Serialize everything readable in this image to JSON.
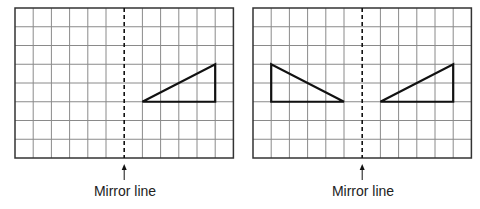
{
  "colors": {
    "grid_line": "#8a8a8a",
    "border": "#333333",
    "shape": "#111111",
    "mirror": "#111111",
    "background": "#ffffff"
  },
  "grid": {
    "columns": 12,
    "rows": 8,
    "mirror_column": 6
  },
  "panels": [
    {
      "id": "before",
      "mirror_label": "Mirror line",
      "triangles": [
        {
          "name": "original-triangle",
          "vertices": [
            [
              7,
              5
            ],
            [
              11,
              5
            ],
            [
              11,
              3
            ]
          ]
        }
      ]
    },
    {
      "id": "after",
      "mirror_label": "Mirror line",
      "triangles": [
        {
          "name": "reflected-triangle",
          "vertices": [
            [
              1,
              3
            ],
            [
              1,
              5
            ],
            [
              5,
              5
            ]
          ]
        },
        {
          "name": "original-triangle",
          "vertices": [
            [
              7,
              5
            ],
            [
              11,
              5
            ],
            [
              11,
              3
            ]
          ]
        }
      ]
    }
  ]
}
